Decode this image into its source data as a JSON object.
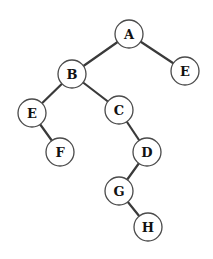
{
  "diagram": {
    "type": "binary-tree",
    "node_radius": 14,
    "colors": {
      "edge": "#3a3a3a",
      "node_stroke": "#4a4a4a",
      "node_fill": "#ffffff",
      "label": "#111111"
    },
    "nodes": [
      {
        "id": "A",
        "label": "A",
        "x": 129,
        "y": 34
      },
      {
        "id": "E1",
        "label": "E",
        "x": 185,
        "y": 71
      },
      {
        "id": "B",
        "label": "B",
        "x": 72,
        "y": 74
      },
      {
        "id": "E2",
        "label": "E",
        "x": 32,
        "y": 113
      },
      {
        "id": "C",
        "label": "C",
        "x": 119,
        "y": 110
      },
      {
        "id": "F",
        "label": "F",
        "x": 60,
        "y": 152
      },
      {
        "id": "D",
        "label": "D",
        "x": 147,
        "y": 152
      },
      {
        "id": "G",
        "label": "G",
        "x": 119,
        "y": 191
      },
      {
        "id": "H",
        "label": "H",
        "x": 148,
        "y": 227
      }
    ],
    "edges": [
      [
        "A",
        "B"
      ],
      [
        "A",
        "E1"
      ],
      [
        "B",
        "E2"
      ],
      [
        "B",
        "C"
      ],
      [
        "E2",
        "F"
      ],
      [
        "C",
        "D"
      ],
      [
        "D",
        "G"
      ],
      [
        "G",
        "H"
      ]
    ]
  }
}
